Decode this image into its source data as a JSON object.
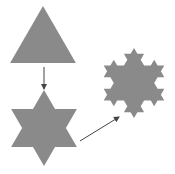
{
  "diagram": {
    "fill_color": "#8a8a8a",
    "arrow_color": "#444444",
    "stages": [
      {
        "name": "iteration-0-triangle",
        "cx": 43,
        "cy": 44,
        "r": 38,
        "level": 0
      },
      {
        "name": "iteration-1-star",
        "cx": 44,
        "cy": 128,
        "r": 38,
        "level": 1
      },
      {
        "name": "iteration-2-snowflake",
        "cx": 134,
        "cy": 83,
        "r": 35,
        "level": 2
      }
    ],
    "arrows": [
      {
        "name": "arrow-down",
        "x1": 44,
        "y1": 67,
        "x2": 44,
        "y2": 89
      },
      {
        "name": "arrow-diagonal",
        "x1": 80,
        "y1": 141,
        "x2": 119,
        "y2": 117
      }
    ]
  }
}
